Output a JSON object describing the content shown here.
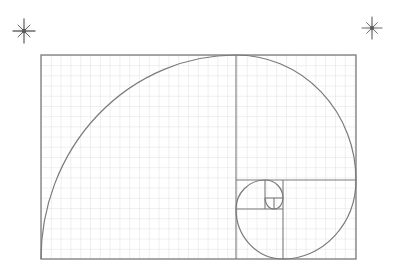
{
  "diagram": {
    "colors": {
      "background": "#ffffff",
      "grid": "#d8d8d8",
      "lines": "#7a7a7a",
      "spiral": "#7a7a7a",
      "sparkle": "#6e6e6e"
    },
    "rectangle": {
      "x": 41,
      "y": 55,
      "width": 315,
      "height": 204
    },
    "grid_spacing": 9.8,
    "squares": [
      {
        "x": 41,
        "y": 55,
        "w": 195,
        "h": 204
      },
      {
        "x": 236,
        "y": 55,
        "w": 120,
        "h": 125
      },
      {
        "x": 283,
        "y": 180,
        "w": 73,
        "h": 79
      },
      {
        "x": 236,
        "y": 209,
        "w": 47,
        "h": 50
      },
      {
        "x": 236,
        "y": 180,
        "w": 29,
        "h": 29
      },
      {
        "x": 265,
        "y": 180,
        "w": 18,
        "h": 18
      },
      {
        "x": 265,
        "y": 198,
        "w": 9,
        "h": 11
      },
      {
        "x": 274,
        "y": 198,
        "w": 9,
        "h": 11
      }
    ],
    "sparkles": [
      {
        "name": "sparkle-left",
        "cx": 24,
        "cy": 31,
        "r": 12
      },
      {
        "name": "sparkle-right",
        "cx": 372,
        "cy": 28,
        "r": 11
      }
    ]
  }
}
